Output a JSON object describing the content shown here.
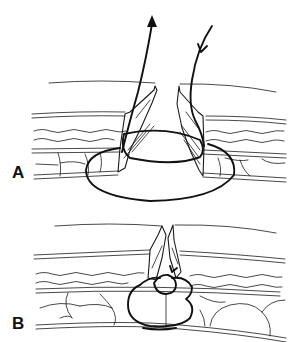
{
  "figure": {
    "panels": [
      {
        "id": "A",
        "label": "A",
        "description": "Suture passed through wound edges with large elliptical loop through tissue layers; needle entry and exit arrows above skin"
      },
      {
        "id": "B",
        "label": "B",
        "description": "Suture tied, wound edges approximated, knot seated at fascia level"
      }
    ],
    "colors": {
      "ink": "#111111",
      "background": "#ffffff"
    }
  }
}
